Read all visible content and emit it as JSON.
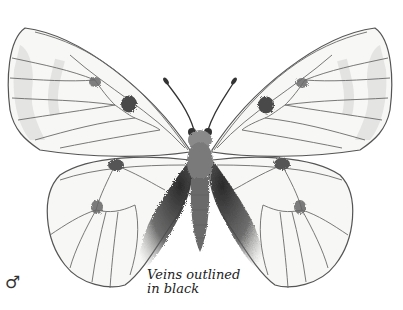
{
  "illustration": {
    "subject": "butterfly",
    "sex_symbol": "♂",
    "caption": {
      "line1": "Veins outlined",
      "line2": "in black"
    },
    "colors": {
      "wing_fill": "#f7f7f5",
      "wing_outline": "#555555",
      "vein": "#6a6a6a",
      "spot": "#4a4a4a",
      "body": "#6b6b6b",
      "hair": "#3a3a3a",
      "submarginal_band": "#dcdcdc"
    }
  }
}
